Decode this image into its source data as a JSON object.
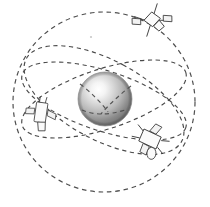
{
  "figure": {
    "background_color": "#ffffff",
    "width": 210,
    "height": 207
  },
  "central_body": {
    "name": "Earth sphere",
    "label": "",
    "center_x": 105,
    "center_y": 99,
    "radius": 27,
    "highlight_color": "#ffffff",
    "mid_color": "#b8b8b8",
    "edge_color": "#8a8a8a",
    "shadow_color": "#6e6e6e",
    "highlight_offset_x": 0.38,
    "highlight_offset_y": 0.32
  },
  "orbits": [
    {
      "name": "outer-boundary-orbit",
      "style": "dashed",
      "color": "#4f4f4f",
      "shape": "circle",
      "center_x": 104,
      "center_y": 102,
      "radius_x": 91,
      "radius_y": 90,
      "rotation_deg": 0
    },
    {
      "name": "inclined-orbit-a",
      "style": "dashed",
      "color": "#4a4a4a",
      "shape": "ellipse",
      "center_x": 104,
      "center_y": 99,
      "radius_x": 86,
      "radius_y": 30,
      "rotation_deg": -18
    },
    {
      "name": "inclined-orbit-b",
      "style": "dashed",
      "color": "#4a4a4a",
      "shape": "ellipse",
      "center_x": 104,
      "center_y": 101,
      "radius_x": 86,
      "radius_y": 30,
      "rotation_deg": 18
    },
    {
      "name": "inclined-orbit-c",
      "style": "dashed",
      "color": "#4a4a4a",
      "shape": "ellipse",
      "center_x": 104,
      "center_y": 100,
      "radius_x": 40,
      "radius_y": 88,
      "rotation_deg": -62
    }
  ],
  "satellites": [
    {
      "name": "satellite-top-right",
      "label": "",
      "x": 152,
      "y": 20,
      "rotation_deg": -32,
      "scale": 1.0
    },
    {
      "name": "satellite-left",
      "label": "",
      "x": 41,
      "y": 112,
      "rotation_deg": 8,
      "scale": 0.95
    },
    {
      "name": "satellite-bottom-right",
      "label": "",
      "x": 150,
      "y": 139,
      "rotation_deg": -62,
      "scale": 1.0
    }
  ],
  "decorations": [
    {
      "name": "speck-mark",
      "x": 91,
      "y": 37,
      "radius": 1.1
    }
  ]
}
